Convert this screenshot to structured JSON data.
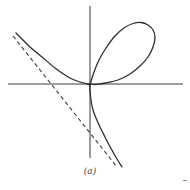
{
  "figure": {
    "label": "(a)",
    "colors": {
      "curve": "#2e2e2e",
      "axis": "#3a3a3a",
      "background": "#ffffff"
    }
  },
  "chart_data": {
    "type": "line",
    "title": "",
    "caption": "(a)",
    "equation": "x^3 + y^3 = 3axy",
    "asymptote": "x + y + a = 0",
    "axes": {
      "origin_px": [
        90,
        84
      ],
      "x_axis_px": [
        [
          8,
          84
        ],
        [
          183,
          84
        ]
      ],
      "y_axis_px": [
        [
          90,
          6
        ],
        [
          90,
          158
        ]
      ]
    },
    "series": [
      {
        "name": "folium-curve",
        "style": "solid",
        "points_px": [
          [
            16,
            33
          ],
          [
            30,
            47
          ],
          [
            42,
            57
          ],
          [
            55,
            68
          ],
          [
            65,
            75
          ],
          [
            72,
            79
          ],
          [
            80,
            82
          ],
          [
            88,
            84
          ],
          [
            90,
            84
          ],
          [
            94,
            72
          ],
          [
            99,
            60
          ],
          [
            106,
            48
          ],
          [
            115,
            36
          ],
          [
            124,
            28
          ],
          [
            133,
            23.5
          ],
          [
            141,
            22.5
          ],
          [
            148,
            25
          ],
          [
            153,
            30
          ],
          [
            155,
            37
          ],
          [
            153,
            47
          ],
          [
            148,
            57
          ],
          [
            140,
            66
          ],
          [
            130,
            74
          ],
          [
            118,
            80
          ],
          [
            105,
            83
          ],
          [
            95,
            84.5
          ],
          [
            90,
            85
          ],
          [
            91,
            100
          ],
          [
            93,
            110
          ],
          [
            96,
            118
          ],
          [
            100,
            127
          ],
          [
            104,
            135
          ],
          [
            108,
            143
          ],
          [
            113,
            152
          ],
          [
            117,
            159
          ],
          [
            122,
            167
          ]
        ]
      },
      {
        "name": "asymptote",
        "style": "dashed",
        "points_px": [
          [
            13,
            36
          ],
          [
            117,
            167
          ]
        ]
      }
    ],
    "grid": false,
    "legend": null
  }
}
